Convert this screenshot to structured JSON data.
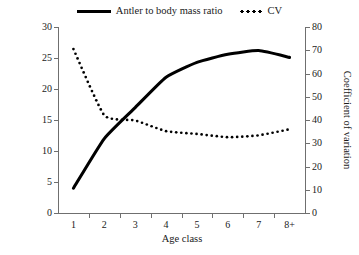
{
  "chart_data": {
    "type": "line",
    "title": "",
    "xlabel": "Age class",
    "ylabel": "Antler beam volume/body mass",
    "y2label": "Coefficient of variation",
    "categories": [
      "1",
      "2",
      "3",
      "4",
      "5",
      "6",
      "7",
      "8+"
    ],
    "ylim": [
      0,
      30
    ],
    "yticks": [
      0,
      5,
      10,
      15,
      20,
      25,
      30
    ],
    "y2lim": [
      0,
      80
    ],
    "y2ticks": [
      0,
      10,
      20,
      30,
      40,
      50,
      60,
      70,
      80
    ],
    "grid": false,
    "legend_position": "top-center",
    "series": [
      {
        "name": "Antler to body mass ratio",
        "axis": "left",
        "style": "solid",
        "color": "#000000",
        "values": [
          4.0,
          12.0,
          17.0,
          21.9,
          24.3,
          25.6,
          26.2,
          25.1
        ]
      },
      {
        "name": "CV",
        "axis": "right",
        "style": "dotted",
        "color": "#000000",
        "values": [
          70.5,
          42.0,
          39.8,
          35.2,
          34.0,
          32.6,
          33.4,
          36.0
        ]
      }
    ]
  },
  "legend": {
    "entries": [
      {
        "label": "Antler to body mass ratio",
        "marker": "solid-line-swatch"
      },
      {
        "label": "CV",
        "marker": "dotted-line-swatch"
      }
    ]
  },
  "axes": {
    "left": {
      "title": "Antler beam volume/body mass",
      "tick_labels": [
        "0",
        "5",
        "10",
        "15",
        "20",
        "25",
        "30"
      ]
    },
    "right": {
      "title": "Coefficient of variation",
      "tick_labels": [
        "0",
        "10",
        "20",
        "30",
        "40",
        "50",
        "60",
        "70",
        "80"
      ]
    },
    "bottom": {
      "title": "Age class",
      "tick_labels": [
        "1",
        "2",
        "3",
        "4",
        "5",
        "6",
        "7",
        "8+"
      ]
    }
  },
  "colors": {
    "line": "#000000",
    "axis": "#6f6f6f",
    "background": "#ffffff",
    "text": "#1a1a1a"
  }
}
